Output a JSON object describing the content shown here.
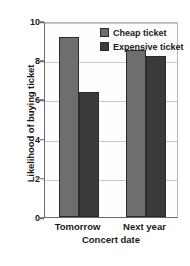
{
  "chart_data": {
    "type": "bar",
    "title": "",
    "subtitle": "",
    "xlabel": "Concert date",
    "ylabel": "Likelihood of buying ticket",
    "categories": [
      "Tomorrow",
      "Next year"
    ],
    "series": [
      {
        "name": "Cheap ticket",
        "color": "#6e6e6e",
        "values": [
          9.2,
          8.5
        ]
      },
      {
        "name": "Expensive ticket",
        "color": "#3a3a3a",
        "values": [
          6.4,
          8.2
        ]
      }
    ],
    "ylim": [
      0,
      10
    ],
    "yticks": [
      0,
      2,
      4,
      6,
      8,
      10
    ],
    "ytick_labels": [
      "0",
      "2",
      "4",
      "6",
      "8",
      "10"
    ],
    "grid": true,
    "legend_position": "top-right"
  },
  "legend": {
    "items": [
      {
        "label": "Cheap ticket",
        "swatch": "legend-swatch-cheap"
      },
      {
        "label": "Expensive ticket",
        "swatch": "legend-swatch-expensive"
      }
    ]
  }
}
